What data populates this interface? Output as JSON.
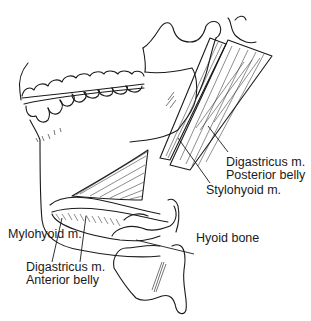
{
  "figure": {
    "background_color": "#ffffff",
    "ink_color": "#1a1a1a"
  },
  "labels": {
    "digastric_posterior": {
      "line1": "Digastricus m.",
      "line2": "Posterior belly"
    },
    "stylohyoid": "Stylohyoid m.",
    "mylohyoid": "Mylohyoid m.",
    "hyoid_bone": "Hyoid bone",
    "digastric_anterior": {
      "line1": "Digastricus m.",
      "line2": "Anterior belly"
    }
  }
}
